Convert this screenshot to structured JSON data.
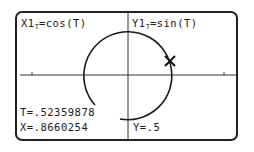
{
  "calculator_screen": {
    "equation_x": {
      "prefix": "X1",
      "subscript": "T",
      "expr": "=cos(T)"
    },
    "equation_y": {
      "prefix": "Y1",
      "subscript": "T",
      "expr": "=sin(T)"
    },
    "trace": {
      "t_value": "T=.52359878",
      "x_value": "X=.8660254",
      "y_value": "Y=.5"
    },
    "graph": {
      "type": "parametric",
      "curve": "circle",
      "cursor_icon": "trace-cursor-x-icon",
      "line_color": "#1a1a1a"
    }
  }
}
